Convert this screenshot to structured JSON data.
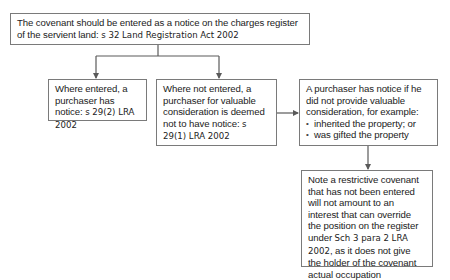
{
  "diagram": {
    "type": "flowchart",
    "nodes": {
      "root": {
        "text": "The covenant should be entered as a notice on the charges register of the servient land: ",
        "citation": "s 32 Land Registration Act 2002"
      },
      "entered": {
        "text": "Where entered, a purchaser has notice: ",
        "citation": "s 29(2) LRA 2002"
      },
      "not_entered": {
        "text": "Where not entered, a purchaser for valuable consideration is deemed not to have notice: ",
        "citation": "s 29(1) LRA 2002"
      },
      "no_value": {
        "text": "A purchaser has notice if he did not provide valuable consideration, for example:",
        "bullets": [
          "inherited the property; or",
          "was gifted the property"
        ]
      },
      "note": {
        "text": "Note a restrictive covenant that has not been entered will not amount to an interest that can override the position on the register under ",
        "citation": "Sch 3 para 2 LRA 2002",
        "text_after": ", as it does not give the holder of the covenant actual occupation"
      }
    },
    "edges": [
      {
        "from": "root",
        "to": "entered"
      },
      {
        "from": "root",
        "to": "not_entered"
      },
      {
        "from": "not_entered",
        "to": "no_value"
      },
      {
        "from": "no_value",
        "to": "note"
      }
    ],
    "colors": {
      "line": "#5a5a5a",
      "border": "#7a7a7a",
      "text": "#222222",
      "background": "#ffffff"
    }
  }
}
